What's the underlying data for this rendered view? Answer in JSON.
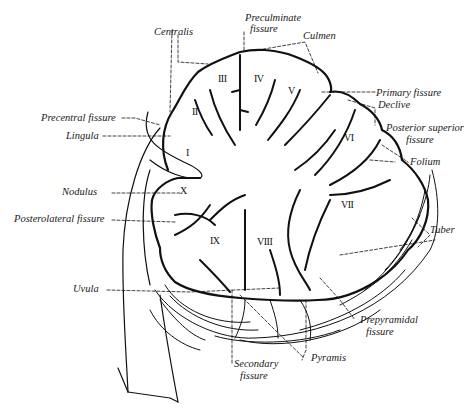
{
  "diagram": {
    "labels": {
      "centralis": "Centralis",
      "preculminate": [
        "Preculminate",
        "fissure"
      ],
      "culmen": "Culmen",
      "primary_fissure": "Primary fissure",
      "declive": "Declive",
      "posterior_superior": [
        "Posterior superior",
        "fissure"
      ],
      "folium": "Folium",
      "tuber": "Tuber",
      "prepyramidal": [
        "Prepyramidal",
        "fissure"
      ],
      "pyramis": "Pyramis",
      "secondary": [
        "Secondary",
        "fissure"
      ],
      "uvula": "Uvula",
      "posterolateral": "Posterolateral fissure",
      "nodulus": "Nodulus",
      "lingula": "Lingula",
      "precentral": "Precentral fissure"
    },
    "lobules": [
      "I",
      "II",
      "III",
      "IV",
      "V",
      "VI",
      "VII",
      "VIII",
      "IX",
      "X"
    ],
    "colors": {
      "ink": "#111111",
      "background": "#ffffff"
    }
  }
}
